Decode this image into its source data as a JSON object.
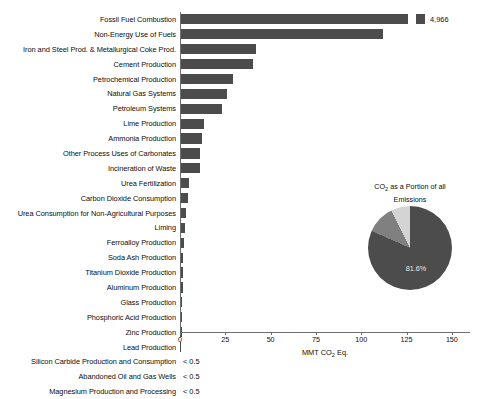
{
  "chart_data": {
    "type": "bar",
    "title": "",
    "xlabel": "MMT CO2 Eq.",
    "xlabel_html": "MMT CO<sub>2</sub> Eq.",
    "ylabel": "",
    "xlim": [
      0,
      160
    ],
    "xticks": [
      0,
      25,
      50,
      75,
      100,
      125,
      150
    ],
    "xticklabels": [
      "0",
      "25",
      "50",
      "75",
      "100",
      "125",
      "150"
    ],
    "grid": false,
    "legend": "none",
    "bar_color": "#4c4c4c",
    "categories": [
      "Fossil Fuel Combustion",
      "Non-Energy Use of Fuels",
      "Iron and Steel Prod. & Metallurgical Coke Prod.",
      "Cement Production",
      "Petrochemical Production",
      "Natural Gas Systems",
      "Petroleum Systems",
      "Lime Production",
      "Ammonia Production",
      "Other Process Uses of Carbonates",
      "Incineration of Waste",
      "Urea Fertilization",
      "Carbon Dioxide Consumption",
      "Urea Consumption for Non-Agricultural Purposes",
      "Liming",
      "Ferroalloy Production",
      "Soda Ash Production",
      "Titanium Dioxide Production",
      "Aluminum Production",
      "Glass Production",
      "Phosphoric Acid Production",
      "Zinc Production",
      "Lead Production",
      "Silicon Carbide Production and Consumption",
      "Abandoned Oil and Gas Wells",
      "Magnesium Production and Processing"
    ],
    "values": [
      4966,
      112,
      42,
      40,
      29,
      26,
      23,
      13,
      12,
      11,
      11,
      5,
      4.5,
      3.5,
      3,
      2,
      1.8,
      1.5,
      1.5,
      1.3,
      1,
      0.9,
      0.5,
      0.4,
      0.3,
      0.2
    ],
    "point_labels": [
      "4,966",
      "",
      "",
      "",
      "",
      "",
      "",
      "",
      "",
      "",
      "",
      "",
      "",
      "",
      "",
      "",
      "",
      "",
      "",
      "",
      "",
      "",
      "",
      "< 0.5",
      "< 0.5",
      "< 0.5"
    ],
    "overflow_bar": {
      "index": 0,
      "value": 4966,
      "label": "4,966",
      "note": "bar broken/truncated at axis limit with detached marker"
    }
  },
  "pie_chart": {
    "type": "pie",
    "title": "CO2 as a Portion of all Emissions",
    "title_html": "CO<sub>2</sub> as a Portion of all<br>Emissions",
    "slices": [
      {
        "label": "CO2",
        "value": 81.6,
        "display": "81.6%",
        "color": "#4c4c4c"
      },
      {
        "label": "other-1",
        "value": 11.0,
        "display": "",
        "color": "#808080"
      },
      {
        "label": "other-2",
        "value": 7.4,
        "display": "",
        "color": "#d4d4d4"
      }
    ],
    "value_label": "81.6%"
  }
}
